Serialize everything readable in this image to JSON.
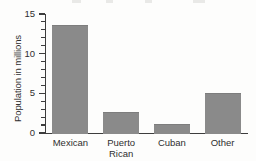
{
  "chart_data": {
    "type": "bar",
    "title": "",
    "xlabel": "",
    "ylabel": "Population in millions",
    "categories": [
      "Mexican",
      "Puerto Rican",
      "Cuban",
      "Other"
    ],
    "category_lines": [
      [
        "Mexican"
      ],
      [
        "Puerto",
        "Rican"
      ],
      [
        "Cuban"
      ],
      [
        "Other"
      ]
    ],
    "values": [
      13.6,
      2.6,
      1.1,
      5.1
    ],
    "ylim": [
      0,
      15
    ],
    "ytick_labels": [
      "0",
      "5",
      "10",
      "15"
    ],
    "ytick_values": [
      0,
      5,
      10,
      15
    ],
    "minor_tick_interval": 1,
    "grid": false,
    "legend": false,
    "bar_color": "#8a8a8a",
    "axis_color": "#3d3d3d",
    "text_color": "#2f2f2f",
    "background_color": "#fdfdfc"
  }
}
